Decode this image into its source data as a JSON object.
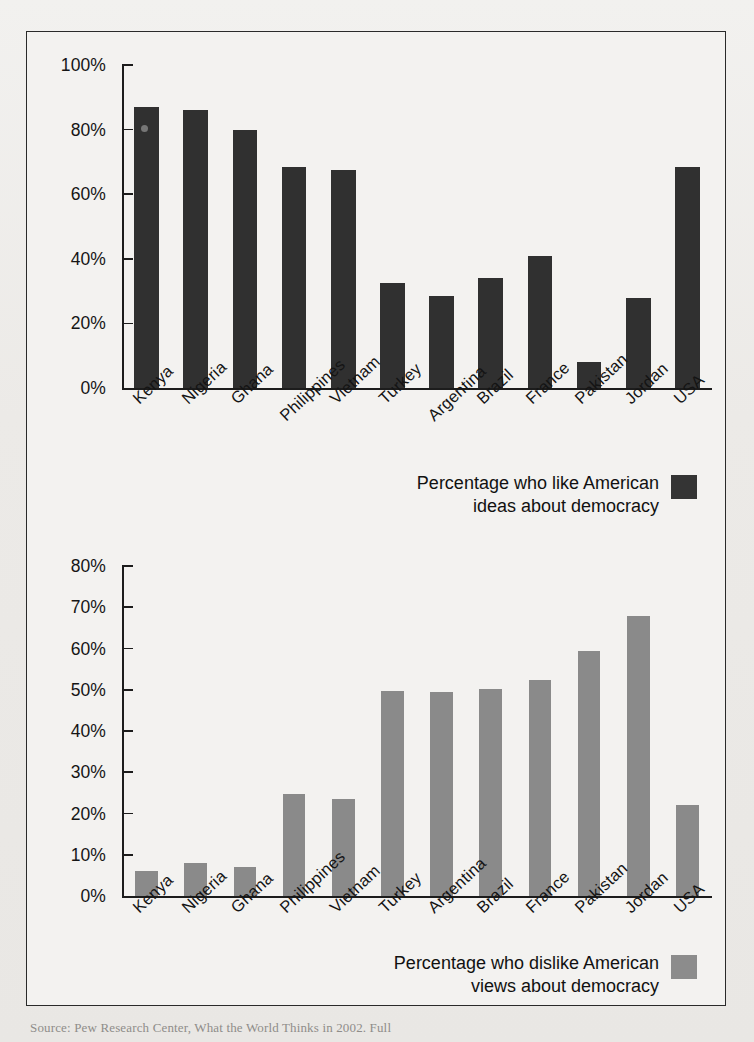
{
  "figure": {
    "source_note": "Source: Pew Research Center, What the World Thinks in 2002. Full",
    "source_label": "Source:"
  },
  "chart_data": [
    {
      "type": "bar",
      "id": "like-american-ideas",
      "title": "",
      "xlabel": "",
      "ylabel": "",
      "ylim": [
        0,
        100
      ],
      "ytick_values": [
        0,
        20,
        40,
        60,
        80,
        100
      ],
      "ytick_labels": [
        "0%",
        "20%",
        "40%",
        "60%",
        "80%",
        "100%"
      ],
      "grid": false,
      "legend_position": "bottom-right",
      "legend": [
        "Percentage who like American\nideas about democracy"
      ],
      "series_color": "#303030",
      "categories": [
        "Kenya",
        "Nigeria",
        "Ghana",
        "Philippines",
        "Vietnam",
        "Turkey",
        "Argentina",
        "Brazil",
        "France",
        "Pakistan",
        "Jordan",
        "USA"
      ],
      "values": [
        87,
        86,
        80,
        68.5,
        67.5,
        32.5,
        28.5,
        34,
        41,
        8,
        28,
        68.5
      ]
    },
    {
      "type": "bar",
      "id": "dislike-american-views",
      "title": "",
      "xlabel": "",
      "ylabel": "",
      "ylim": [
        0,
        80
      ],
      "ytick_values": [
        0,
        10,
        20,
        30,
        40,
        50,
        60,
        70,
        80
      ],
      "ytick_labels": [
        "0%",
        "10%",
        "20%",
        "30%",
        "40%",
        "50%",
        "60%",
        "70%",
        "80%"
      ],
      "grid": false,
      "legend_position": "bottom-right",
      "legend": [
        "Percentage who dislike American\nviews about democracy"
      ],
      "series_color": "#8a8a8a",
      "categories": [
        "Kenya",
        "Nigeria",
        "Ghana",
        "Philippines",
        "Vietnam",
        "Turkey",
        "Argentina",
        "Brazil",
        "France",
        "Pakistan",
        "Jordan",
        "USA"
      ],
      "values": [
        6,
        8,
        7,
        24.8,
        23.6,
        49.6,
        49.4,
        50.3,
        52.3,
        59.5,
        68,
        22
      ]
    }
  ]
}
